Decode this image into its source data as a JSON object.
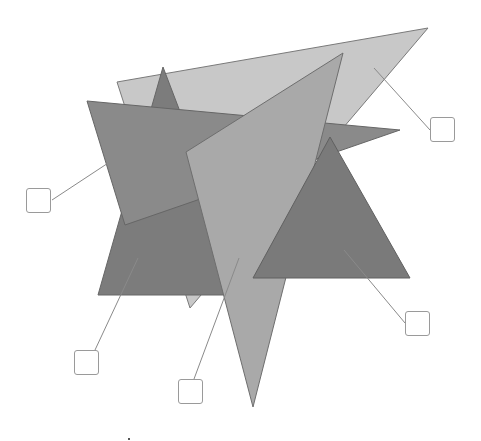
{
  "diagram": {
    "type": "overlapping-shapes-labeling",
    "shapes": [
      {
        "id": "light-triangle",
        "points": "117,82 428,28 190,308",
        "fill": "#c8c8c8",
        "stroke": "#7a7a7a"
      },
      {
        "id": "spike-triangle",
        "points": "163,67 98,295 250,295",
        "fill": "#7c7c7c",
        "stroke": "#666666"
      },
      {
        "id": "star-triangle",
        "points": "87,101 400,130 125,225",
        "fill": "#8a8a8a",
        "stroke": "#666666"
      },
      {
        "id": "medium-triangle",
        "points": "343,53 186,152 253,407",
        "fill": "#a9a9a9",
        "stroke": "#6e6e6e"
      },
      {
        "id": "dark-triangle",
        "points": "330,137 253,278 410,278",
        "fill": "#7a7a7a",
        "stroke": "#606060"
      }
    ],
    "leaders": [
      {
        "id": "leader-1",
        "x1": 137,
        "y1": 144,
        "x2": 52,
        "y2": 200
      },
      {
        "id": "leader-2",
        "x1": 374,
        "y1": 68,
        "x2": 430,
        "y2": 130
      },
      {
        "id": "leader-3",
        "x1": 344,
        "y1": 250,
        "x2": 405,
        "y2": 323
      },
      {
        "id": "leader-4",
        "x1": 138,
        "y1": 258,
        "x2": 95,
        "y2": 350
      },
      {
        "id": "leader-5",
        "x1": 239,
        "y1": 258,
        "x2": 194,
        "y2": 379
      }
    ],
    "label_boxes": [
      {
        "id": "label-box-1",
        "x": 26,
        "y": 188,
        "text": ""
      },
      {
        "id": "label-box-2",
        "x": 430,
        "y": 117,
        "text": ""
      },
      {
        "id": "label-box-3",
        "x": 405,
        "y": 311,
        "text": ""
      },
      {
        "id": "label-box-4",
        "x": 74,
        "y": 350,
        "text": ""
      },
      {
        "id": "label-box-5",
        "x": 178,
        "y": 379,
        "text": ""
      }
    ],
    "colors": {
      "leader": "#8a8a8a",
      "box_border": "#9a9a9a",
      "background": "#ffffff"
    }
  }
}
